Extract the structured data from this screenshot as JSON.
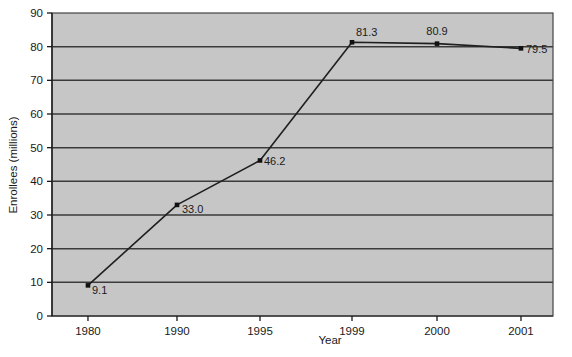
{
  "chart_data": {
    "type": "line",
    "title": "",
    "subtitle": "",
    "xlabel": "Year",
    "ylabel": "Enrollees (millions)",
    "categories": [
      "1980",
      "1990",
      "1995",
      "1999",
      "2000",
      "2001"
    ],
    "values": [
      9.1,
      33.0,
      46.2,
      81.3,
      80.9,
      79.5
    ],
    "point_labels": [
      "9.1",
      "33.0",
      "46.2",
      "81.3",
      "80.9",
      "79.5"
    ],
    "series": [
      {
        "name": "Enrollees",
        "values": [
          9.1,
          33.0,
          46.2,
          81.3,
          80.9,
          79.5
        ]
      }
    ],
    "ylim": [
      0,
      90
    ],
    "ytick_values": [
      0,
      10,
      20,
      30,
      40,
      50,
      60,
      70,
      80,
      90
    ],
    "ytick_labels": [
      "0",
      "10",
      "20",
      "30",
      "40",
      "50",
      "60",
      "70",
      "80",
      "90"
    ],
    "xtick_labels": [
      "1980",
      "1990",
      "1995",
      "1999",
      "2000",
      "2001"
    ],
    "grid": true,
    "grid_axis": "y",
    "legend": false,
    "legend_position": "none",
    "marker": "square",
    "colors": {
      "plot_background": "#c6c6c6",
      "gridline": "#3a3a3a",
      "line": "#1f1f1f",
      "marker": "#111111",
      "axis": "#1a1a1a",
      "text": "#1a1a1a",
      "page_background": "#ffffff"
    }
  },
  "axes": {
    "y_title": "Enrollees (millions)",
    "x_title": "Year"
  }
}
